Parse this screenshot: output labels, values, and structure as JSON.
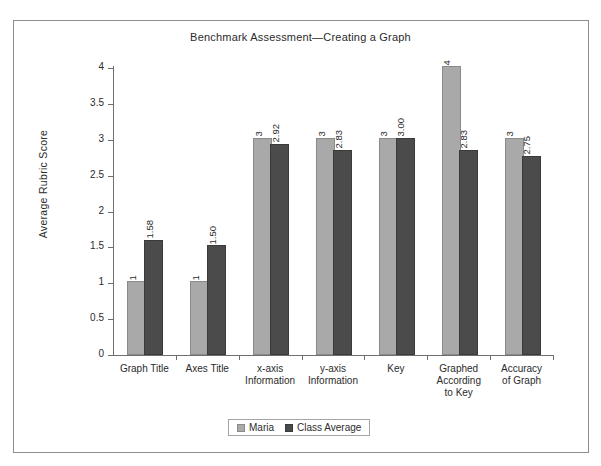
{
  "chart_data": {
    "type": "bar",
    "title": "Benchmark Assessment—Creating a Graph",
    "xlabel": "",
    "ylabel": "Average Rubric Score",
    "ylim": [
      0,
      4
    ],
    "ytick_labels": [
      "4",
      "3.5",
      "3",
      "2.5",
      "2",
      "1.5",
      "1",
      "0.5",
      "0"
    ],
    "ytick_values": [
      4,
      3.5,
      3,
      2.5,
      2,
      1.5,
      1,
      0.5,
      0
    ],
    "grid": false,
    "legend_position": "bottom-center",
    "categories": [
      "Graph Title",
      "Axes Title",
      "x-axis Information",
      "y-axis Information",
      "Key",
      "Graphed According to Key",
      "Accuracy of Graph"
    ],
    "category_lines": [
      [
        "Graph Title"
      ],
      [
        "Axes Title"
      ],
      [
        "x-axis",
        "Information"
      ],
      [
        "y-axis",
        "Information"
      ],
      [
        "Key"
      ],
      [
        "Graphed",
        "According",
        "to Key"
      ],
      [
        "Accuracy",
        "of Graph"
      ]
    ],
    "series": [
      {
        "name": "Maria",
        "color": "#a9a9a9",
        "values": [
          1,
          1,
          3,
          3,
          3,
          4,
          3
        ],
        "labels": [
          "1",
          "1",
          "3",
          "3",
          "3",
          "4",
          "3"
        ]
      },
      {
        "name": "Class Average",
        "color": "#4b4b4b",
        "values": [
          1.58,
          1.5,
          2.92,
          2.83,
          3.0,
          2.83,
          2.75
        ],
        "labels": [
          "1.58",
          "1.50",
          "2.92",
          "2.83",
          "3.00",
          "2.83",
          "2.75"
        ]
      }
    ]
  },
  "legend": {
    "items": [
      {
        "label": "Maria"
      },
      {
        "label": "Class Average"
      }
    ]
  }
}
